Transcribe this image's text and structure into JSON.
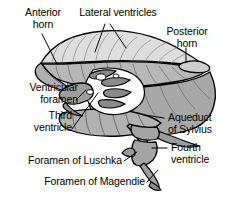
{
  "figure": {
    "background_color": "#ffffff",
    "outline_color": "#000000",
    "fills": {
      "lateral_ventricle_light": "#d9d9d9",
      "mid_gray": "#b4b4b4",
      "dark_gray": "#9a9a9a",
      "deep_gray": "#808080",
      "white": "#ffffff"
    }
  },
  "labels": {
    "anterior_horn": "Anterior\nhorn",
    "lateral_ventricles": "Lateral ventricles",
    "posterior_horn": "Posterior\nhorn",
    "ventricular_foramen": "Ventricular\nforamen",
    "third_ventricle": "Third\nventricle",
    "aqueduct_of_sylvius": "Aqueduct\nof Sylvius",
    "fourth_ventricle": "Fourth\nventricle",
    "foramen_of_luschka": "Foramen of Luschka",
    "foramen_of_magendie": "Foramen of Magendie"
  },
  "leader_lines": [
    {
      "name": "anterior-horn-leader",
      "from": [
        42,
        34
      ],
      "to": [
        58,
        63
      ]
    },
    {
      "name": "lateral-ventricles-leader-left",
      "from": [
        104,
        24
      ],
      "to": [
        96,
        50
      ]
    },
    {
      "name": "lateral-ventricles-leader-right",
      "from": [
        110,
        24
      ],
      "to": [
        124,
        47
      ]
    },
    {
      "name": "posterior-horn-leader",
      "from": [
        185,
        50
      ],
      "to": [
        185,
        62
      ]
    },
    {
      "name": "ventricular-foramen-leader",
      "from": [
        76,
        101
      ],
      "to": [
        86,
        91
      ]
    },
    {
      "name": "third-ventricle-leader",
      "from": [
        72,
        128
      ],
      "to": [
        97,
        94
      ]
    },
    {
      "name": "aqueduct-leader",
      "from": [
        163,
        118
      ],
      "to": [
        146,
        114
      ]
    },
    {
      "name": "fourth-ventricle-leader",
      "from": [
        166,
        148
      ],
      "to": [
        152,
        148
      ]
    },
    {
      "name": "luschka-leader",
      "from": [
        123,
        160
      ],
      "to": [
        136,
        152
      ]
    },
    {
      "name": "magendie-leader",
      "from": [
        146,
        181
      ],
      "to": [
        157,
        170
      ]
    }
  ]
}
